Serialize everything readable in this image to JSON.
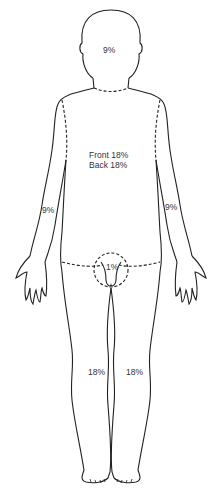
{
  "diagram": {
    "type": "rule-of-nines-body-chart",
    "regions": {
      "head": {
        "label": "9%"
      },
      "trunk": {
        "front_label": "Front 18%",
        "back_label": "Back 18%"
      },
      "left_arm": {
        "label": "9%"
      },
      "right_arm": {
        "label": "9%"
      },
      "perineum": {
        "label": "1%"
      },
      "left_leg": {
        "label": "18%"
      },
      "right_leg": {
        "label": "18%"
      }
    },
    "colors": {
      "line": "#222222",
      "text": "#333333",
      "background": "#ffffff"
    }
  }
}
